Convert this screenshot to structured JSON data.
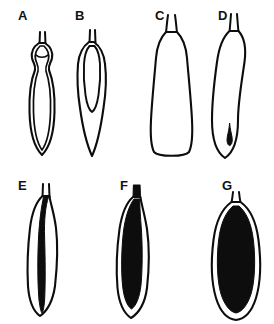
{
  "figure": {
    "background_color": "#ffffff",
    "ink_color": "#0d0d0d",
    "type": "scientific-line-drawing-plate",
    "rows": 2,
    "columns_row1": 4,
    "columns_row2": 3,
    "panel_count": 7
  },
  "panels": [
    {
      "label": "A",
      "label_x": 18,
      "label_y": 20,
      "row": 1,
      "description": "narrow elongated club-shaped outline with double contour wall and constricted neck, hollow interior",
      "fill_state": "empty",
      "has_inner_body": false,
      "tip": "forked-stalk"
    },
    {
      "label": "B",
      "label_x": 75,
      "label_y": 20,
      "row": 1,
      "description": "elongated outline with narrow open inner sac extending to mid-length",
      "fill_state": "empty",
      "has_inner_body": true,
      "tip": "forked-stalk"
    },
    {
      "label": "C",
      "label_x": 155,
      "label_y": 20,
      "row": 1,
      "description": "broad club-shaped hollow outline with blunt rounded base and split tip",
      "fill_state": "empty",
      "has_inner_body": false,
      "tip": "forked-stalk"
    },
    {
      "label": "D",
      "label_x": 218,
      "label_y": 20,
      "row": 1,
      "description": "tapered outline containing a single small dark teardrop inclusion near the base",
      "fill_state": "minimal",
      "has_inner_body": true,
      "tip": "forked-stalk"
    },
    {
      "label": "E",
      "label_x": 18,
      "label_y": 190,
      "row": 2,
      "description": "slender outline with a thin dark internal strand running nearly full length",
      "fill_state": "thin-strand",
      "has_inner_body": true,
      "tip": "forked-stalk"
    },
    {
      "label": "F",
      "label_x": 120,
      "label_y": 190,
      "row": 2,
      "description": "outline with a thick elongated dark internal mass filling most of the cavity",
      "fill_state": "mostly-filled",
      "has_inner_body": true,
      "tip": "solid-stalk"
    },
    {
      "label": "G",
      "label_x": 222,
      "label_y": 190,
      "row": 2,
      "description": "broad oval outline almost entirely occupied by a large dark ovoid body",
      "fill_state": "filled",
      "has_inner_body": true,
      "tip": "forked-stalk"
    }
  ]
}
